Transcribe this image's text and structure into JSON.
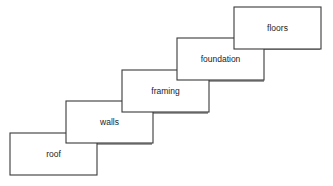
{
  "canvas": {
    "width": 333,
    "height": 186,
    "background_color": "#ffffff"
  },
  "diagram": {
    "type": "staircase-process-diagram",
    "stroke_color": "#3a3a3a",
    "box_fill_color": "#ffffff",
    "label_color": "#1b1b1b",
    "box_width": 87,
    "box_height": 42,
    "stages": [
      {
        "id": "roof",
        "label": "roof",
        "x": 10,
        "y": 133,
        "order": 1
      },
      {
        "id": "walls",
        "label": "walls",
        "x": 66,
        "y": 101,
        "order": 2
      },
      {
        "id": "framing",
        "label": "framing",
        "x": 122,
        "y": 70,
        "order": 3
      },
      {
        "id": "foundation",
        "label": "foundation",
        "x": 177,
        "y": 38,
        "order": 4
      },
      {
        "id": "floors",
        "label": "floors",
        "x": 234,
        "y": 7,
        "order": 5
      }
    ],
    "connectors": [
      {
        "id": "roof-to-walls",
        "from": "roof",
        "to": "walls",
        "x1": 97,
        "y1": 144,
        "x2": 152,
        "y2": 144
      },
      {
        "id": "walls-to-framing",
        "from": "walls",
        "to": "framing",
        "x1": 152,
        "y1": 113,
        "x2": 208,
        "y2": 113
      },
      {
        "id": "framing-to-foundation",
        "from": "framing",
        "to": "foundation",
        "x1": 208,
        "y1": 81,
        "x2": 264,
        "y2": 81
      },
      {
        "id": "foundation-to-floors",
        "from": "foundation",
        "to": "floors",
        "x1": 264,
        "y1": 49,
        "x2": 320,
        "y2": 49
      }
    ]
  }
}
